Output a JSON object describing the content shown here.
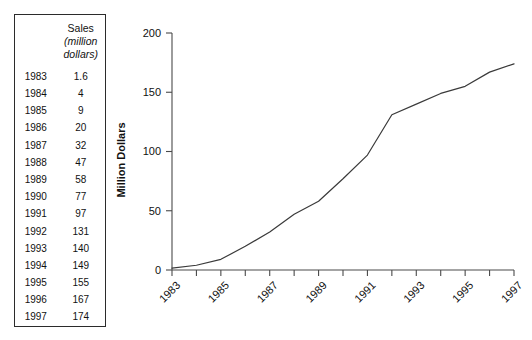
{
  "table": {
    "header_blank": "",
    "header_title": "Sales",
    "header_unit": "(million dollars)",
    "header_unit_line1": "(million",
    "header_unit_line2": "dollars)",
    "columns": [
      "",
      "Sales (million dollars)"
    ],
    "rows": [
      {
        "year": "1983",
        "sales": "1.6"
      },
      {
        "year": "1984",
        "sales": "4"
      },
      {
        "year": "1985",
        "sales": "9"
      },
      {
        "year": "1986",
        "sales": "20"
      },
      {
        "year": "1987",
        "sales": "32"
      },
      {
        "year": "1988",
        "sales": "47"
      },
      {
        "year": "1989",
        "sales": "58"
      },
      {
        "year": "1990",
        "sales": "77"
      },
      {
        "year": "1991",
        "sales": "97"
      },
      {
        "year": "1992",
        "sales": "131"
      },
      {
        "year": "1993",
        "sales": "140"
      },
      {
        "year": "1994",
        "sales": "149"
      },
      {
        "year": "1995",
        "sales": "155"
      },
      {
        "year": "1996",
        "sales": "167"
      },
      {
        "year": "1997",
        "sales": "174"
      }
    ]
  },
  "chart_data": {
    "type": "line",
    "title": "",
    "xlabel": "",
    "ylabel": "Million Dollars",
    "x": [
      1983,
      1984,
      1985,
      1986,
      1987,
      1988,
      1989,
      1990,
      1991,
      1992,
      1993,
      1994,
      1995,
      1996,
      1997
    ],
    "values": [
      1.6,
      4,
      9,
      20,
      32,
      47,
      58,
      77,
      97,
      131,
      140,
      149,
      155,
      167,
      174
    ],
    "series": [
      {
        "name": "Sales",
        "values": [
          1.6,
          4,
          9,
          20,
          32,
          47,
          58,
          77,
          97,
          131,
          140,
          149,
          155,
          167,
          174
        ]
      }
    ],
    "categories": [
      "1983",
      "1984",
      "1985",
      "1986",
      "1987",
      "1988",
      "1989",
      "1990",
      "1991",
      "1992",
      "1993",
      "1994",
      "1995",
      "1996",
      "1997"
    ],
    "ylim": [
      0,
      200
    ],
    "yticks": [
      0,
      50,
      100,
      150,
      200
    ],
    "ytick_labels": [
      "0",
      "50",
      "100",
      "150",
      "200"
    ],
    "xlim": [
      1983,
      1997
    ],
    "xticks": [
      1983,
      1984,
      1985,
      1986,
      1987,
      1988,
      1989,
      1990,
      1991,
      1992,
      1993,
      1994,
      1995,
      1996,
      1997
    ],
    "xtick_labels_shown": [
      "1983",
      "1985",
      "1987",
      "1989",
      "1991",
      "1993",
      "1995",
      "1997"
    ],
    "xtick_label_rotation_deg": -45,
    "grid": false,
    "legend": false,
    "legend_position": "none",
    "line_color": "#3a3a3a",
    "axis_color": "#4a4a4a",
    "background_color": "#ffffff"
  }
}
